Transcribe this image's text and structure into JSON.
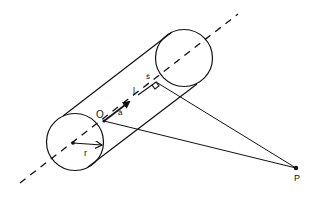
{
  "diagram": {
    "type": "geometry",
    "labels": {
      "origin": "O",
      "axis_unit_vector": "â",
      "axis_distance": "l",
      "perpendicular_unit_vector": "ŝ",
      "radius": "r",
      "point": "P"
    },
    "colors": {
      "stroke": "#111111",
      "background": "#ffffff"
    }
  }
}
